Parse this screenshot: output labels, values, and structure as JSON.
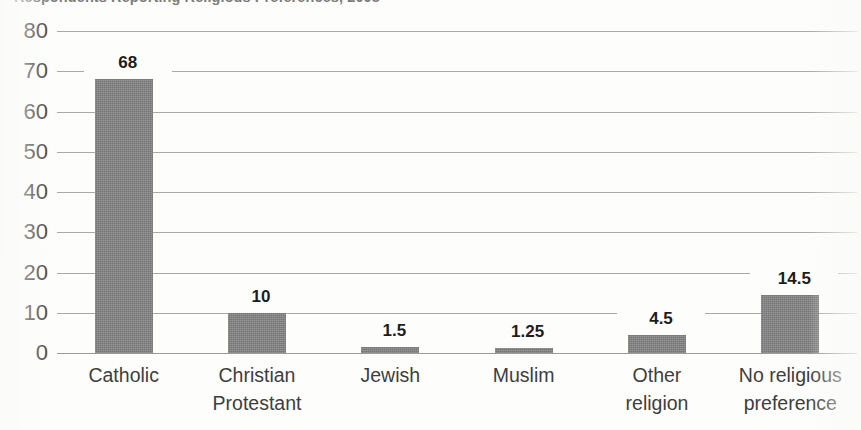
{
  "chart_data": {
    "type": "bar",
    "title": "Respondents Reporting Religious Preferences, 2008",
    "title_visibility": "clipped at top edge of screenshot",
    "xlabel": "",
    "ylabel": "",
    "categories": [
      "Catholic",
      "Christian\nProtestant",
      "Jewish",
      "Muslim",
      "Other\nreligion",
      "No religious\npreference"
    ],
    "values": [
      68,
      10,
      1.5,
      1.25,
      4.5,
      14.5
    ],
    "value_labels": [
      "68",
      "10",
      "1.5",
      "1.25",
      "4.5",
      "14.5"
    ],
    "ylim": [
      0,
      80
    ],
    "ytick_step": 10,
    "yticks": [
      "80",
      "70",
      "60",
      "50",
      "40",
      "30",
      "20",
      "10",
      "0"
    ],
    "grid": true,
    "grid_orientation": "horizontal",
    "legend": "none",
    "bar_color": "#7f7f7f",
    "grid_color": "#a9a9a9",
    "text_color": "#3e3e3e",
    "label_color": "#1d1d1d",
    "background_color": "#fdfdfc"
  }
}
